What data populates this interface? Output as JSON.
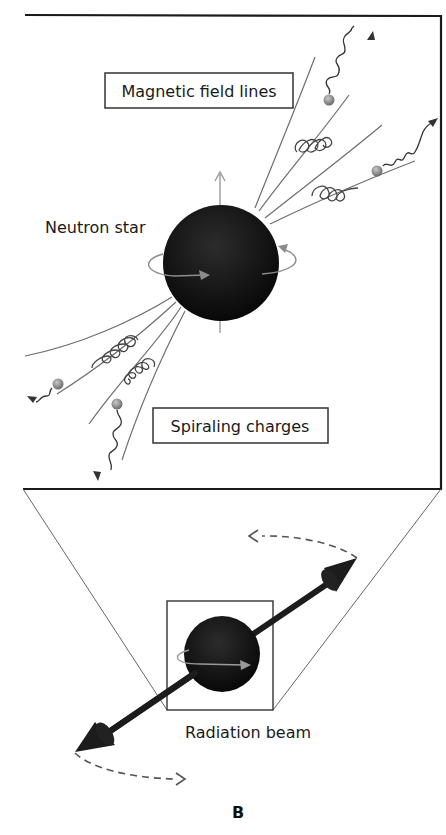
{
  "figure": {
    "letter": "B",
    "top_panel": {
      "labels": {
        "magnetic_field_lines": "Magnetic field lines",
        "neutron_star": "Neutron star",
        "spiraling_charges": "Spiraling charges"
      }
    },
    "bottom_panel": {
      "labels": {
        "radiation_beam": "Radiation beam"
      }
    },
    "colors": {
      "star": "#111111",
      "field_line": "#6e6e6e",
      "rotation_arrow": "#8c8c8c",
      "charge_particle": "#8a8a8a",
      "frame": "#1a1a1a",
      "beam": "#1c1c1c"
    }
  }
}
